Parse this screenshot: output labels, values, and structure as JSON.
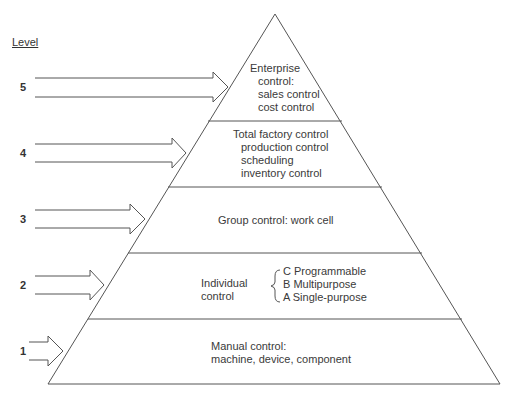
{
  "diagram": {
    "heading": "Level",
    "levels": [
      {
        "number": "5",
        "lines": [
          "Enterprise",
          "control:",
          "sales control",
          "cost control"
        ]
      },
      {
        "number": "4",
        "lines": [
          "Total factory control",
          "production control",
          "scheduling",
          "inventory control"
        ]
      },
      {
        "number": "3",
        "lines": [
          "Group control: work cell"
        ]
      },
      {
        "number": "2",
        "label_lines": [
          "Individual",
          "control"
        ],
        "sub_items": [
          "C Programmable",
          "B Multipurpose",
          "A Single-purpose"
        ]
      },
      {
        "number": "1",
        "lines": [
          "Manual control:",
          "machine, device, component"
        ]
      }
    ],
    "colors": {
      "stroke": "#555555",
      "text": "#3a3a3a",
      "background": "#ffffff"
    }
  }
}
